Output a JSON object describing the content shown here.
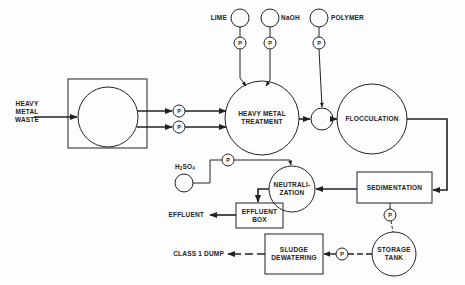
{
  "diagram": {
    "colors": {
      "line": "#222222",
      "background": "#fdfdfd"
    },
    "inputs": {
      "waste": "HEAVY METAL\nWASTE",
      "lime": "LIME",
      "naoh": "NaOH",
      "polymer": "POLYMER",
      "h2so4_main": "H",
      "h2so4_sub1": "2",
      "h2so4_mid": "SO",
      "h2so4_sub2": "4"
    },
    "units": {
      "heavy_metal_treatment": "HEAVY METAL\nTREATMENT",
      "flocculation": "FLOCCULATION",
      "sedimentation": "SEDIMENTATION",
      "neutralization": "NEUTRALI-\nZATION",
      "effluent_box": "EFFLUENT\nBOX",
      "storage_tank": "STORAGE\nTANK",
      "sludge_dewatering": "SLUDGE\nDEWATERING"
    },
    "outputs": {
      "effluent": "EFFLUENT",
      "class1_dump": "CLASS 1 DUMP"
    },
    "pump_label": "P",
    "pumps": [
      {
        "id": "pump-lime",
        "x": 240,
        "y": 43
      },
      {
        "id": "pump-naoh",
        "x": 270,
        "y": 43
      },
      {
        "id": "pump-polymer",
        "x": 319,
        "y": 43
      },
      {
        "id": "pump-feed-1",
        "x": 179,
        "y": 111
      },
      {
        "id": "pump-feed-2",
        "x": 179,
        "y": 127
      },
      {
        "id": "pump-h2so4",
        "x": 228,
        "y": 160
      },
      {
        "id": "pump-sedimentation",
        "x": 390,
        "y": 215
      },
      {
        "id": "pump-sludge",
        "x": 342,
        "y": 254
      }
    ]
  }
}
